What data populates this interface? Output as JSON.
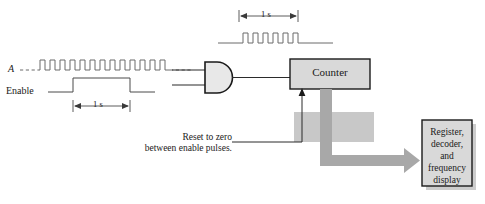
{
  "diagram": {
    "signals": {
      "input_label": "A",
      "enable_label": "Enable",
      "input_pulse_count": 14,
      "gated_pulse_count": 6,
      "enable_duration_label": "1 s",
      "gated_duration_label": "1 s"
    },
    "blocks": {
      "and_gate": "AND gate",
      "counter": "Counter",
      "display": "Register,\ndecoder,\nand\nfrequency\ndisplay",
      "display_lines": [
        "Register,",
        "decoder,",
        "and",
        "frequency",
        "display"
      ]
    },
    "annotations": {
      "reset_note_line1": "Reset to zero",
      "reset_note_line2": "between enable pulses."
    },
    "colors": {
      "stroke": "#2b2b2b",
      "waveform": "#555555",
      "block_fill": "#d9d9d9",
      "block_stroke": "#1a1a1a",
      "bus_arrow": "#a8a8a8",
      "shadow": "#9a9a9a",
      "background": "#ffffff"
    }
  }
}
